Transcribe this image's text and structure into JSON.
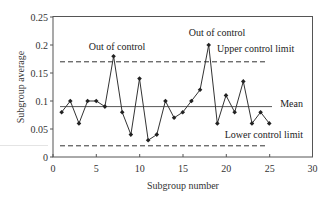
{
  "chart_data": {
    "type": "line",
    "title": "",
    "xlabel": "Subgroup number",
    "ylabel": "Subgroup average",
    "xlim": [
      0,
      30
    ],
    "ylim": [
      0,
      0.25
    ],
    "x_ticks": [
      0,
      5,
      10,
      15,
      20,
      25,
      30
    ],
    "x_tick_labels": [
      "0",
      "5",
      "10",
      "15",
      "20",
      "25",
      "30"
    ],
    "y_ticks": [
      0,
      0.05,
      0.1,
      0.15,
      0.2,
      0.25
    ],
    "y_tick_labels": [
      "0",
      "0.05",
      "0.1",
      "0.15",
      "0.2",
      "0.25"
    ],
    "grid": false,
    "legend": null,
    "series": [
      {
        "name": "Subgroup average",
        "x": [
          1,
          2,
          3,
          4,
          5,
          6,
          7,
          8,
          9,
          10,
          11,
          12,
          13,
          14,
          15,
          16,
          17,
          18,
          19,
          20,
          21,
          22,
          23,
          24,
          25
        ],
        "values": [
          0.08,
          0.1,
          0.06,
          0.1,
          0.1,
          0.09,
          0.18,
          0.08,
          0.04,
          0.14,
          0.03,
          0.04,
          0.1,
          0.07,
          0.08,
          0.1,
          0.12,
          0.2,
          0.06,
          0.11,
          0.08,
          0.135,
          0.06,
          0.08,
          0.06
        ],
        "style": "solid line with diamond markers"
      }
    ],
    "reference_lines": [
      {
        "name": "Upper control limit",
        "y": 0.17,
        "style": "dashed",
        "x_range": [
          1,
          25
        ]
      },
      {
        "name": "Mean",
        "y": 0.09,
        "style": "solid",
        "x_range": [
          1,
          25.5
        ]
      },
      {
        "name": "Lower control limit",
        "y": 0.02,
        "style": "dashed",
        "x_range": [
          1,
          25
        ]
      }
    ],
    "annotations": [
      {
        "text": "Out of control",
        "x": 7,
        "y": 0.18
      },
      {
        "text": "Out of control",
        "x": 18,
        "y": 0.2
      },
      {
        "text": "Upper control limit",
        "y": 0.17
      },
      {
        "text": "Mean",
        "y": 0.09
      },
      {
        "text": "Lower control limit",
        "y": 0.02
      }
    ]
  },
  "labels": {
    "xlabel": "Subgroup number",
    "ylabel": "Subgroup average",
    "annot_ooc_1": "Out of control",
    "annot_ooc_2": "Out of control",
    "annot_ucl": "Upper control limit",
    "annot_mean": "Mean",
    "annot_lcl": "Lower control limit",
    "xt0": "0",
    "xt1": "5",
    "xt2": "10",
    "xt3": "15",
    "xt4": "20",
    "xt5": "25",
    "xt6": "30",
    "yt0": "0",
    "yt1": "0.05",
    "yt2": "0.1",
    "yt3": "0.15",
    "yt4": "0.2",
    "yt5": "0.25"
  },
  "colors": {
    "line": "#333333",
    "axis": "#444444",
    "text": "#333333"
  }
}
